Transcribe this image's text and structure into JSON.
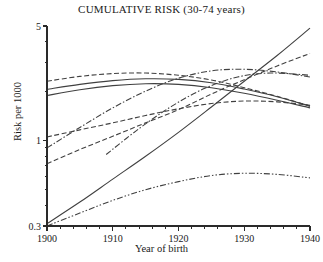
{
  "chart_data": {
    "type": "line",
    "title": "CUMULATIVE RISK (30-74 years)",
    "xlabel": "Year of birth",
    "ylabel": "Risk per 1000",
    "xlim": [
      1900,
      1940
    ],
    "ylim": [
      0.3,
      5
    ],
    "yscale": "log",
    "xticks": [
      1900,
      1910,
      1920,
      1930,
      1940
    ],
    "xtick_labels": [
      "1900",
      "1910",
      "1920",
      "1930",
      "1940"
    ],
    "xminor_step": 2,
    "yticks": [
      0.3,
      1,
      5
    ],
    "ytick_labels": [
      "0.3",
      "1",
      "5"
    ],
    "yminor_ticks": [
      0.4,
      0.5,
      0.6,
      0.7,
      0.8,
      0.9,
      2,
      3,
      4
    ],
    "grid": false,
    "legend": "none",
    "line_color": "#404040",
    "series": [
      {
        "name": "series-1-solid-rising-steep",
        "style": "solid",
        "x": [
          1900,
          1905,
          1910,
          1915,
          1920,
          1925,
          1930,
          1935,
          1940
        ],
        "values": [
          0.31,
          0.42,
          0.58,
          0.8,
          1.12,
          1.6,
          2.3,
          3.3,
          4.85
        ]
      },
      {
        "name": "series-2-dashed-rising",
        "style": "dashed",
        "x": [
          1900,
          1905,
          1910,
          1915,
          1920,
          1925,
          1930,
          1935,
          1940
        ],
        "values": [
          0.72,
          0.88,
          1.06,
          1.28,
          1.54,
          1.92,
          2.35,
          2.85,
          3.4
        ]
      },
      {
        "name": "series-3-solid-flat-high",
        "style": "solid",
        "x": [
          1900,
          1905,
          1910,
          1915,
          1920,
          1925,
          1930,
          1935,
          1940
        ],
        "values": [
          2.05,
          2.2,
          2.32,
          2.38,
          2.36,
          2.25,
          2.06,
          1.85,
          1.62
        ]
      },
      {
        "name": "series-4-solid-flat-mid",
        "style": "solid",
        "x": [
          1900,
          1905,
          1910,
          1915,
          1920,
          1925,
          1930,
          1935,
          1940
        ],
        "values": [
          1.88,
          2.04,
          2.16,
          2.22,
          2.2,
          2.1,
          1.94,
          1.76,
          1.58
        ]
      },
      {
        "name": "series-5-dashed-arched",
        "style": "dashed",
        "x": [
          1900,
          1905,
          1910,
          1915,
          1920,
          1925,
          1930,
          1935,
          1940
        ],
        "values": [
          2.3,
          2.46,
          2.56,
          2.58,
          2.5,
          2.34,
          2.1,
          1.86,
          1.62
        ]
      },
      {
        "name": "series-6-dashdot-rising-from-1900",
        "style": "dashdot",
        "x": [
          1900,
          1905,
          1910,
          1915,
          1920,
          1925,
          1930,
          1935,
          1940
        ],
        "values": [
          0.9,
          1.2,
          1.58,
          2.0,
          2.4,
          2.66,
          2.72,
          2.62,
          2.44
        ]
      },
      {
        "name": "series-7-dashdot-rising-from-1909",
        "style": "dashdot",
        "x": [
          1909,
          1914,
          1919,
          1924,
          1929,
          1934,
          1940
        ],
        "values": [
          0.82,
          1.18,
          1.62,
          2.08,
          2.44,
          2.58,
          2.5
        ]
      },
      {
        "name": "series-8-dashed-gentle-rise",
        "style": "dashed",
        "x": [
          1900,
          1905,
          1910,
          1915,
          1920,
          1925,
          1930,
          1935,
          1940
        ],
        "values": [
          1.05,
          1.16,
          1.28,
          1.42,
          1.56,
          1.68,
          1.74,
          1.72,
          1.64
        ]
      },
      {
        "name": "series-9-dashdotdot-low-arch",
        "style": "dashdotdot",
        "x": [
          1900,
          1905,
          1910,
          1915,
          1920,
          1925,
          1930,
          1935,
          1940
        ],
        "values": [
          0.3,
          0.36,
          0.43,
          0.5,
          0.56,
          0.61,
          0.63,
          0.62,
          0.59
        ]
      }
    ]
  }
}
